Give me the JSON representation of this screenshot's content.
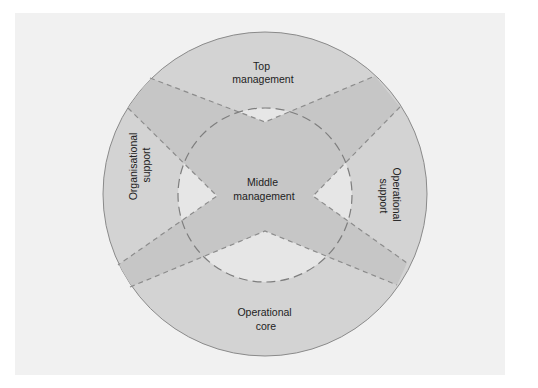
{
  "diagram": {
    "colors": {
      "page": "#ffffff",
      "panel": "#f1f1f1",
      "outer_disc": "#d3d3d3",
      "band": "#c6c6c6",
      "inner_triangle": "#e6e6e6",
      "outline": "#8a8a8a",
      "dash": "#8c8c8c",
      "text": "#222222"
    },
    "regions": [
      {
        "id": "top",
        "lines": [
          "Top",
          "management"
        ]
      },
      {
        "id": "left",
        "lines": [
          "Organisational",
          "support"
        ]
      },
      {
        "id": "center",
        "lines": [
          "Middle",
          "management"
        ]
      },
      {
        "id": "right",
        "lines": [
          "Operational",
          "support"
        ]
      },
      {
        "id": "bottom",
        "lines": [
          "Operational",
          "core"
        ]
      }
    ]
  }
}
